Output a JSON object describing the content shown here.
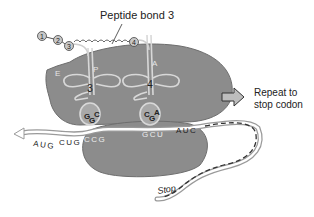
{
  "title_label": "Peptide bond 3",
  "amino_acids": [
    "1",
    "2",
    "3",
    "4"
  ],
  "sites": {
    "E": "E",
    "P": "P",
    "A": "A"
  },
  "trna": [
    {
      "number": "3",
      "anticodon": [
        "G",
        "G",
        "C"
      ]
    },
    {
      "number": "4",
      "anticodon": [
        "C",
        "G",
        "A"
      ]
    }
  ],
  "mrna": {
    "codons_left": [
      "AUG",
      "CUG"
    ],
    "codon_p": "CCG",
    "codon_a": "GCU",
    "codon_next": "AUC",
    "stop_label": "Stop"
  },
  "repeat": {
    "line1": "Repeat to",
    "line2": "stop codon"
  },
  "colors": {
    "ribosome": "#8c8c8c",
    "trna": "#d8d8d8",
    "text": "#222222",
    "arrow": "#bdbdbd"
  }
}
